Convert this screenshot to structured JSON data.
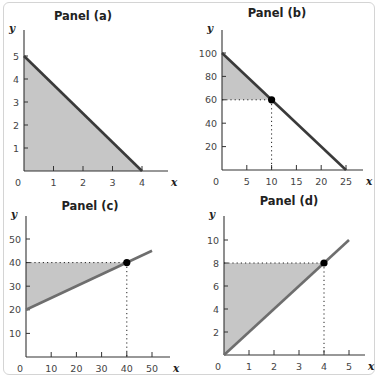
{
  "colors": {
    "shade": "#c6c6c6",
    "axis": "#333333",
    "line_dark": "#3a3a3a",
    "line_gray": "#6e6e6e",
    "dot": "#000000",
    "frame": "#d4d4d4"
  },
  "chart_data": [
    {
      "type": "line",
      "title": "Panel (a)",
      "xlabel": "x",
      "ylabel": "y",
      "xticks": [
        0,
        1,
        2,
        3,
        4
      ],
      "yticks": [
        1,
        2,
        3,
        4,
        5
      ],
      "xlim": [
        0,
        4.5
      ],
      "ylim": [
        0,
        5.5
      ],
      "series": [
        {
          "name": "line",
          "x": [
            0,
            4
          ],
          "y": [
            5,
            0
          ]
        }
      ],
      "shaded_region": {
        "polygon": [
          [
            0,
            0
          ],
          [
            0,
            5
          ],
          [
            4,
            0
          ]
        ]
      },
      "point": null
    },
    {
      "type": "line",
      "title": "Panel (b)",
      "xlabel": "x",
      "ylabel": "y",
      "xticks": [
        0,
        5,
        10,
        15,
        20,
        25
      ],
      "yticks": [
        20,
        40,
        60,
        80,
        100
      ],
      "xlim": [
        0,
        28
      ],
      "ylim": [
        0,
        110
      ],
      "series": [
        {
          "name": "line",
          "x": [
            0,
            25
          ],
          "y": [
            100,
            0
          ]
        }
      ],
      "shaded_region": {
        "polygon": [
          [
            0,
            60
          ],
          [
            0,
            100
          ],
          [
            10,
            60
          ]
        ]
      },
      "point": {
        "x": 10,
        "y": 60
      }
    },
    {
      "type": "line",
      "title": "Panel (c)",
      "xlabel": "x",
      "ylabel": "y",
      "xticks": [
        0,
        10,
        20,
        30,
        40,
        50
      ],
      "yticks": [
        10,
        20,
        30,
        40,
        50
      ],
      "xlim": [
        0,
        57
      ],
      "ylim": [
        0,
        55
      ],
      "series": [
        {
          "name": "line",
          "x": [
            0,
            50
          ],
          "y": [
            20,
            45
          ]
        }
      ],
      "shaded_region": {
        "polygon": [
          [
            0,
            20
          ],
          [
            0,
            40
          ],
          [
            40,
            40
          ]
        ]
      },
      "point": {
        "x": 40,
        "y": 40
      }
    },
    {
      "type": "line",
      "title": "Panel (d)",
      "xlabel": "x",
      "ylabel": "y",
      "xticks": [
        0,
        1,
        2,
        3,
        4,
        5
      ],
      "yticks": [
        2,
        4,
        6,
        8,
        10
      ],
      "xlim": [
        0,
        5.6
      ],
      "ylim": [
        0,
        11
      ],
      "series": [
        {
          "name": "line",
          "x": [
            0,
            5
          ],
          "y": [
            0,
            10
          ]
        }
      ],
      "shaded_region": {
        "polygon": [
          [
            0,
            0
          ],
          [
            0,
            8
          ],
          [
            4,
            8
          ]
        ]
      },
      "point": {
        "x": 4,
        "y": 8
      }
    }
  ],
  "panels_px": [
    {
      "x0": 24,
      "y0": 171,
      "xScale": 29.5,
      "yScale": 23.0,
      "xAxisEnd": 168,
      "yAxisTop": 30,
      "titleX": 83,
      "titleY": 20,
      "lineStyle": "dark"
    },
    {
      "x0": 222,
      "y0": 170,
      "xScale": 4.96,
      "yScale": 1.17,
      "xAxisEnd": 363,
      "yAxisTop": 30,
      "titleX": 277,
      "titleY": 17,
      "lineStyle": "dark"
    },
    {
      "x0": 26,
      "y0": 357,
      "xScale": 2.52,
      "yScale": 2.36,
      "xAxisEnd": 170,
      "yAxisTop": 216,
      "titleX": 90,
      "titleY": 210,
      "lineStyle": "gray"
    },
    {
      "x0": 224,
      "y0": 355,
      "xScale": 25.0,
      "yScale": 11.5,
      "xAxisEnd": 365,
      "yAxisTop": 216,
      "titleX": 289,
      "titleY": 205,
      "lineStyle": "gray"
    }
  ]
}
